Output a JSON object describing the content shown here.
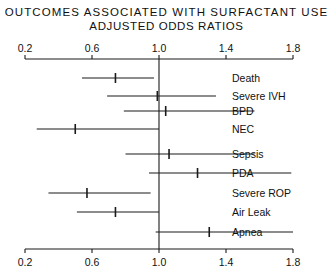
{
  "title": {
    "line1": "OUTCOMES ASSOCIATED WITH SURFACTANT USE",
    "line2": "ADJUSTED ODDS RATIOS"
  },
  "chart_data": {
    "type": "forest",
    "title": "OUTCOMES ASSOCIATED WITH SURFACTANT USE",
    "subtitle": "ADJUSTED ODDS RATIOS",
    "xlabel": "",
    "ylabel": "",
    "xlim": [
      0.2,
      1.8
    ],
    "grid": false,
    "legend": "none",
    "reference_line": 1.0,
    "tick_values": [
      0.2,
      0.6,
      1.0,
      1.4,
      1.8
    ],
    "tick_labels": [
      "0.2",
      "0.6",
      "1.0",
      "1.4",
      "1.8"
    ],
    "categories": [
      "Death",
      "Severe IVH",
      "BPD",
      "NEC",
      "Sepsis",
      "PDA",
      "Severe ROP",
      "Air Leak",
      "Apnea"
    ],
    "odds_ratios": [
      0.74,
      0.99,
      1.04,
      0.5,
      1.06,
      1.23,
      0.57,
      0.74,
      1.3
    ],
    "ci_low": [
      0.54,
      0.69,
      0.79,
      0.27,
      0.8,
      0.94,
      0.34,
      0.51,
      0.98
    ],
    "ci_high": [
      0.97,
      1.34,
      1.57,
      1.0,
      1.57,
      1.79,
      0.95,
      1.0,
      1.8
    ],
    "series": [
      {
        "name": "Death",
        "or": 0.74,
        "ci": [
          0.54,
          0.97
        ]
      },
      {
        "name": "Severe IVH",
        "or": 0.99,
        "ci": [
          0.69,
          1.34
        ]
      },
      {
        "name": "BPD",
        "or": 1.04,
        "ci": [
          0.79,
          1.57
        ]
      },
      {
        "name": "NEC",
        "or": 0.5,
        "ci": [
          0.27,
          1.0
        ]
      },
      {
        "name": "Sepsis",
        "or": 1.06,
        "ci": [
          0.8,
          1.57
        ]
      },
      {
        "name": "PDA",
        "or": 1.23,
        "ci": [
          0.94,
          1.79
        ]
      },
      {
        "name": "Severe ROP",
        "or": 0.57,
        "ci": [
          0.34,
          0.95
        ]
      },
      {
        "name": "Air Leak",
        "or": 0.74,
        "ci": [
          0.51,
          1.0
        ]
      },
      {
        "name": "Apnea",
        "or": 1.3,
        "ci": [
          0.98,
          1.8
        ]
      }
    ]
  },
  "colors": {
    "ink": "#1a1a1a",
    "background": "#ffffff"
  }
}
